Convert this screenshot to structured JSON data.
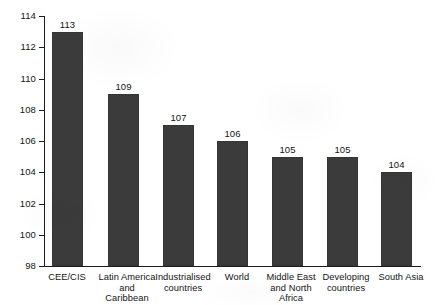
{
  "chart_data": {
    "type": "bar",
    "title": "",
    "subtitle": "",
    "xlabel": "",
    "ylabel": "",
    "ylim": [
      98,
      114
    ],
    "yticks": [
      98,
      100,
      102,
      104,
      106,
      108,
      110,
      112,
      114
    ],
    "ytick_labels": [
      "98",
      "100",
      "102",
      "104",
      "106",
      "108",
      "110",
      "112",
      "114"
    ],
    "grid": false,
    "legend": null,
    "bar_color": "#3b3b3b",
    "axis_color": "#1d1d1d",
    "background_color": "#ffffff",
    "categories": [
      "CEE/CIS",
      "Latin America and Caribbean",
      "Industrialised countries",
      "World",
      "Middle East and North Africa",
      "Developing countries",
      "South Asia"
    ],
    "category_label_lines": [
      [
        "CEE/CIS"
      ],
      [
        "Latin America",
        "and",
        "Caribbean"
      ],
      [
        "Industrialised",
        "countries"
      ],
      [
        "World"
      ],
      [
        "Middle East",
        "and North",
        "Africa"
      ],
      [
        "Developing",
        "countries"
      ],
      [
        "South Asia"
      ]
    ],
    "values": [
      113,
      109,
      107,
      106,
      105,
      105,
      104
    ],
    "data_labels": [
      "113",
      "109",
      "107",
      "106",
      "105",
      "105",
      "104"
    ]
  }
}
